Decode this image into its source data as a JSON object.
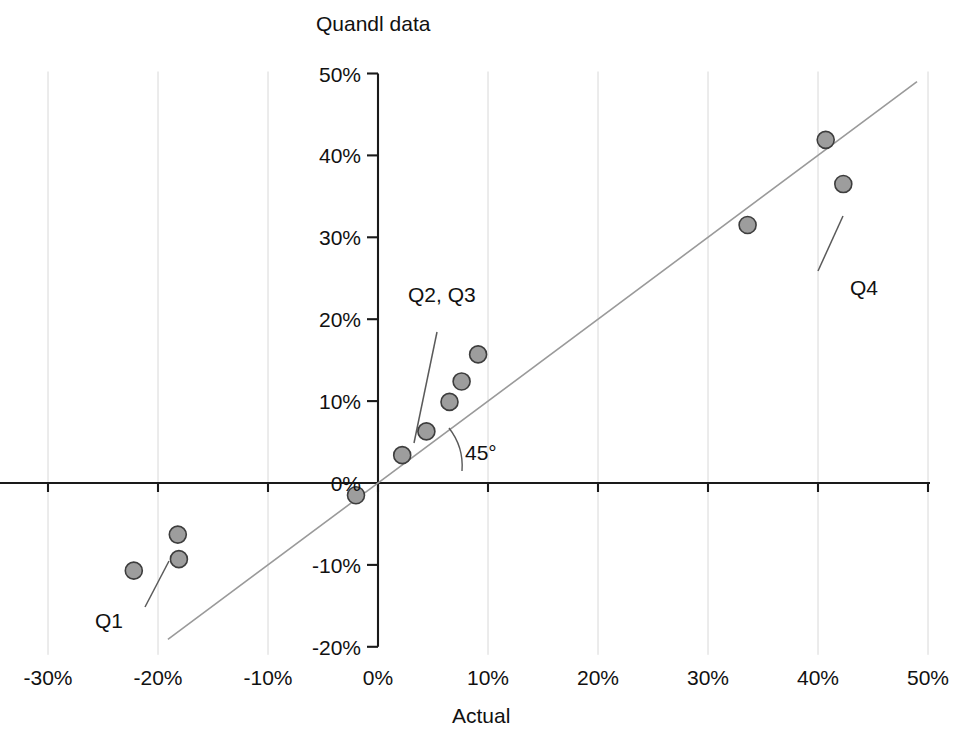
{
  "chart_data": {
    "type": "scatter",
    "title": "",
    "xlabel": "Actual",
    "ylabel": "Quandl data",
    "xlim": [
      -30,
      50
    ],
    "ylim": [
      -20,
      50
    ],
    "grid": true,
    "legend": "none",
    "x_ticks": [
      "-30%",
      "-20%",
      "-10%",
      "0%",
      "10%",
      "20%",
      "30%",
      "40%",
      "50%"
    ],
    "x_tick_values": [
      -30,
      -20,
      -10,
      0,
      10,
      20,
      30,
      40,
      50
    ],
    "y_ticks": [
      "-20%",
      "-10%",
      "0%",
      "10%",
      "20%",
      "30%",
      "40%",
      "50%"
    ],
    "y_tick_values": [
      -20,
      -10,
      0,
      10,
      20,
      30,
      40,
      50
    ],
    "unit": "%",
    "points": [
      {
        "x": -22.2,
        "y": -10.7,
        "group": "Q1"
      },
      {
        "x": -18.2,
        "y": -6.3,
        "group": "Q1"
      },
      {
        "x": -18.1,
        "y": -9.3,
        "group": "Q1"
      },
      {
        "x": -2.0,
        "y": -1.5,
        "group": ""
      },
      {
        "x": 2.2,
        "y": 3.4,
        "group": ""
      },
      {
        "x": 4.4,
        "y": 6.3,
        "group": "Q2"
      },
      {
        "x": 6.5,
        "y": 9.9,
        "group": ""
      },
      {
        "x": 7.6,
        "y": 12.4,
        "group": ""
      },
      {
        "x": 9.1,
        "y": 15.7,
        "group": "Q3"
      },
      {
        "x": 33.6,
        "y": 31.5,
        "group": ""
      },
      {
        "x": 40.7,
        "y": 41.9,
        "group": "Q4"
      },
      {
        "x": 42.3,
        "y": 36.5,
        "group": ""
      }
    ],
    "reference_line": {
      "label": "45°",
      "slope": 1,
      "intercept": 0,
      "x_start": -19.1,
      "x_end": 49.0
    },
    "annotations": [
      {
        "label": "Q1",
        "text_x": 95,
        "text_y": 628,
        "line": [
          145,
          607,
          169,
          561
        ]
      },
      {
        "label": "Q2,  Q3",
        "text_x": 408,
        "text_y": 302,
        "line": [
          414,
          443,
          437,
          332
        ]
      },
      {
        "label": "Q4",
        "text_x": 850,
        "text_y": 295,
        "line": [
          843,
          216,
          818,
          271
        ]
      },
      {
        "label": "45°",
        "text_x": 465,
        "text_y": 460,
        "line": null
      }
    ],
    "point_style": {
      "fill": "#9d9d9d",
      "stroke": "#3d3d3d",
      "radius": 8.5
    },
    "colors": {
      "axis": "#1a1a1a",
      "grid": "#d8d8d8",
      "reference_line": "#9a9a9a",
      "leader": "#5a5a5a",
      "text": "#111111",
      "background": "#ffffff"
    }
  },
  "labels": {
    "y_axis_title": "Quandl data",
    "x_axis_title": "Actual",
    "q1": "Q1",
    "q2q3": "Q2,  Q3",
    "q4": "Q4",
    "angle": "45°"
  }
}
